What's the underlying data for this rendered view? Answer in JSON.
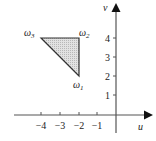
{
  "figure": {
    "axes": {
      "x_label": "u",
      "y_label": "v",
      "x_ticks": [
        {
          "value": -4,
          "label": "−4"
        },
        {
          "value": -3,
          "label": "−3"
        },
        {
          "value": -2,
          "label": "−2"
        },
        {
          "value": -1,
          "label": "−1"
        }
      ],
      "y_ticks": [
        {
          "value": 1,
          "label": "1"
        },
        {
          "value": 2,
          "label": "2"
        },
        {
          "value": 3,
          "label": "3"
        },
        {
          "value": 4,
          "label": "4"
        }
      ]
    },
    "region": {
      "shape": "triangle",
      "fill_color": "#d6d6d6",
      "stroke_color": "#333333",
      "vertices": [
        {
          "name": "omega1",
          "label": "ω",
          "sub": "1",
          "u": -2,
          "v": 2
        },
        {
          "name": "omega2",
          "label": "ω",
          "sub": "2",
          "u": -2,
          "v": 4
        },
        {
          "name": "omega3",
          "label": "ω",
          "sub": "3",
          "u": -4,
          "v": 4
        }
      ]
    }
  }
}
